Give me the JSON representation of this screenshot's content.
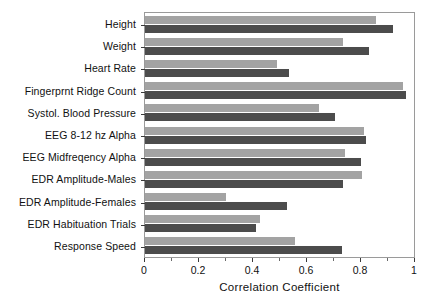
{
  "chart_data": {
    "type": "bar",
    "orientation": "horizontal",
    "title": "",
    "xlabel": "Correlation Coefficient",
    "ylabel": "",
    "xlim": [
      0,
      1
    ],
    "xticks": [
      0,
      0.2,
      0.4,
      0.6,
      0.8,
      1
    ],
    "xticklabels": [
      "0",
      "0.2",
      "0.4",
      "0.6",
      "0.8",
      "1"
    ],
    "grid": false,
    "legend": "none",
    "categories": [
      "Height",
      "Weight",
      "Heart Rate",
      "Fingerprnt Ridge Count",
      "Systol. Blood Pressure",
      "EEG 8-12 hz Alpha",
      "EEG Midfreqency Alpha",
      "EDR Amplitude-Males",
      "EDR Amplitude-Females",
      "EDR Habituation Trials",
      "Response Speed"
    ],
    "series": [
      {
        "name": "light-bar",
        "color": "#a3a3a3",
        "values": [
          0.855,
          0.735,
          0.49,
          0.955,
          0.645,
          0.81,
          0.74,
          0.805,
          0.3,
          0.425,
          0.555
        ]
      },
      {
        "name": "dark-bar",
        "color": "#4c4c4c",
        "values": [
          0.92,
          0.83,
          0.535,
          0.965,
          0.705,
          0.82,
          0.8,
          0.735,
          0.525,
          0.41,
          0.73
        ]
      }
    ]
  },
  "axis": {
    "frame_color": "#9a9a9a",
    "tick_color": "#3a3a3a"
  }
}
